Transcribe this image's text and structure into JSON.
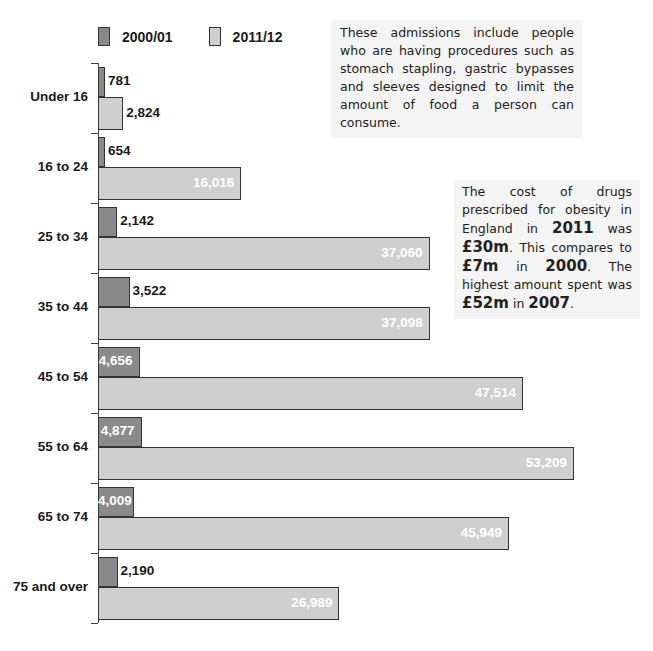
{
  "legend": {
    "series1": {
      "label": "2000/01",
      "color": "#8a8a8a"
    },
    "series2": {
      "label": "2011/12",
      "color": "#cfcfcf"
    }
  },
  "notes": {
    "note1": "These admissions include people who are having procedures such as stomach stapling, gastric bypasses and sleeves designed to limit the amount of food a person can consume.",
    "note2": {
      "t1": "The cost of drugs prescribed for obesity in England in ",
      "b1": "2011",
      "t2": " was ",
      "b2": "£30m",
      "t3": ". This compares to ",
      "b3": "£7m",
      "t4": " in ",
      "b4": "2000",
      "t5": ". The highest amount spent was ",
      "b5": "£52m",
      "t6": " in ",
      "b6": "2007",
      "t7": "."
    }
  },
  "chart_data": {
    "type": "bar",
    "orientation": "horizontal",
    "title": "",
    "xlabel": "",
    "ylabel": "Age group",
    "categories": [
      "Under 16",
      "16 to 24",
      "25 to 34",
      "35 to 44",
      "45 to 54",
      "55 to 64",
      "65 to 74",
      "75 and over"
    ],
    "series": [
      {
        "name": "2000/01",
        "values": [
          781,
          654,
          2142,
          3522,
          4656,
          4877,
          4009,
          2190
        ],
        "labels": [
          "781",
          "654",
          "2,142",
          "3,522",
          "4,656",
          "4,877",
          "4,009",
          "2,190"
        ]
      },
      {
        "name": "2011/12",
        "values": [
          2824,
          16016,
          37060,
          37098,
          47514,
          53209,
          45949,
          26989
        ],
        "labels": [
          "2,824",
          "16,016",
          "37,060",
          "37,098",
          "47,514",
          "53,209",
          "45,949",
          "26,989"
        ]
      }
    ],
    "xlim": [
      0,
      55000
    ],
    "grid": false,
    "legend_position": "top"
  }
}
